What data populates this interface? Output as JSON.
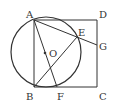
{
  "diagram": {
    "type": "geometry",
    "stroke_color": "#333333",
    "points": {
      "A": {
        "label": "A",
        "x": 34,
        "y": 20,
        "lx": 26,
        "ly": 18
      },
      "B": {
        "label": "B",
        "x": 34,
        "y": 87,
        "lx": 26,
        "ly": 100
      },
      "C": {
        "label": "C",
        "x": 97,
        "y": 87,
        "lx": 99,
        "ly": 100
      },
      "D": {
        "label": "D",
        "x": 97,
        "y": 20,
        "lx": 99,
        "ly": 18
      },
      "E": {
        "label": "E",
        "x": 77,
        "y": 37,
        "lx": 78,
        "ly": 36
      },
      "F": {
        "label": "F",
        "x": 57,
        "y": 87,
        "lx": 57,
        "ly": 100
      },
      "G": {
        "label": "G",
        "x": 97,
        "y": 45,
        "lx": 99,
        "ly": 50
      },
      "O": {
        "label": "O",
        "x": 45,
        "y": 53,
        "lx": 49,
        "ly": 57
      }
    },
    "circle": {
      "center": "O",
      "cx": 46,
      "cy": 52,
      "r": 35
    },
    "segments": [
      [
        "A",
        "D"
      ],
      [
        "D",
        "C"
      ],
      [
        "C",
        "B"
      ],
      [
        "B",
        "A"
      ],
      [
        "A",
        "F"
      ],
      [
        "A",
        "G"
      ],
      [
        "B",
        "E"
      ]
    ]
  }
}
